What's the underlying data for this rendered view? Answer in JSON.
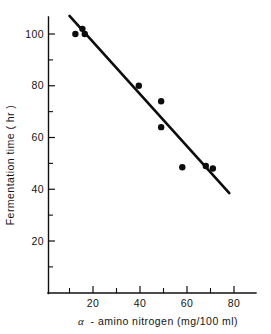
{
  "chart_data": {
    "type": "scatter",
    "title": "",
    "xlabel": "α - amino nitrogen  (mg/100 ml)",
    "ylabel": "Fermentation time ( hr )",
    "xlim": [
      0,
      82
    ],
    "ylim": [
      0,
      110
    ],
    "grid": false,
    "legend": null,
    "x_ticks_major": [
      20,
      40,
      60,
      80
    ],
    "x_ticks_minor": [
      10,
      30,
      50,
      70
    ],
    "y_ticks_major": [
      20,
      40,
      60,
      80,
      100
    ],
    "y_ticks_minor": [
      10,
      30,
      50,
      70,
      90
    ],
    "x_tick_labels": [
      "20",
      "40",
      "60",
      "80"
    ],
    "y_tick_labels": [
      "20",
      "40",
      "60",
      "80",
      "100"
    ],
    "points": [
      {
        "x": 12.5,
        "y": 100.0
      },
      {
        "x": 15.5,
        "y": 102.0
      },
      {
        "x": 16.5,
        "y": 100.0
      },
      {
        "x": 39.5,
        "y": 80.0
      },
      {
        "x": 49.0,
        "y": 74.0
      },
      {
        "x": 49.0,
        "y": 64.0
      },
      {
        "x": 58.0,
        "y": 48.5
      },
      {
        "x": 68.0,
        "y": 49.0
      },
      {
        "x": 71.0,
        "y": 48.0
      }
    ],
    "series": [
      {
        "name": "observations",
        "marker": "filled-circle",
        "color": "#0d0d0d",
        "x": [
          12.5,
          15.5,
          16.5,
          39.5,
          49.0,
          49.0,
          58.0,
          68.0,
          71.0
        ],
        "values": [
          100.0,
          102.0,
          100.0,
          80.0,
          74.0,
          64.0,
          48.5,
          49.0,
          48.0
        ]
      },
      {
        "name": "regression-line",
        "marker": "line",
        "color": "#0d0d0d",
        "x": [
          10.0,
          78.0
        ],
        "values": [
          107.0,
          38.5
        ]
      }
    ],
    "trend_line": {
      "x_start": 10.0,
      "y_start": 107.0,
      "x_end": 78.0,
      "y_end": 38.5
    },
    "axis_labels": {
      "x_axis_prefix": "α",
      "x_axis_rest": "- amino nitrogen  (mg/100 ml)",
      "y_axis": "Fermentation time ( hr )"
    }
  },
  "colors": {
    "background": "#ffffff",
    "ink": "#0d0d0d",
    "marker": "#0d0d0d",
    "axis": "#101010"
  }
}
